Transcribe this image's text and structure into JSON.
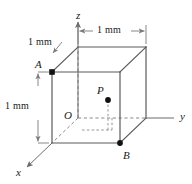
{
  "figure": {
    "type": "3d-cube-diagram",
    "colors": {
      "edge_solid": "#5a5a5a",
      "edge_hidden": "#8a8a8a",
      "axis": "#6a6a6a",
      "dimension": "#7a7a7a",
      "text": "#1a1a1a",
      "marker": "#111111",
      "background": "#ffffff"
    },
    "axes": [
      {
        "name": "z",
        "label": "z",
        "x": 76,
        "y": 10
      },
      {
        "name": "y",
        "label": "y",
        "x": 180,
        "y": 112
      },
      {
        "name": "x",
        "label": "x",
        "x": 17,
        "y": 168
      }
    ],
    "points": [
      {
        "name": "A",
        "label": "A",
        "x": 36,
        "y": 60,
        "marker": "square",
        "marker_x": 52,
        "marker_y": 72
      },
      {
        "name": "B",
        "label": "B",
        "x": 123,
        "y": 152,
        "marker": "dot",
        "marker_x": 120,
        "marker_y": 143
      },
      {
        "name": "P",
        "label": "P",
        "x": 98,
        "y": 88,
        "marker": "dot",
        "marker_x": 108,
        "marker_y": 100
      },
      {
        "name": "O",
        "label": "O",
        "x": 64,
        "y": 112,
        "marker": "none"
      }
    ],
    "dimensions": [
      {
        "name": "top-edge-width",
        "label": "1 mm",
        "x": 100,
        "y": 28,
        "orientation": "horizontal"
      },
      {
        "name": "depth-oblique",
        "label": "1 mm",
        "x": 36,
        "y": 40,
        "orientation": "oblique"
      },
      {
        "name": "left-edge-height",
        "label": "1 mm",
        "x": 8,
        "y": 108,
        "orientation": "vertical"
      }
    ],
    "geometry": {
      "front_left": 52,
      "front_right": 120,
      "front_top": 72,
      "front_bottom": 143,
      "depth_dx": 26,
      "depth_dy": -25
    }
  }
}
